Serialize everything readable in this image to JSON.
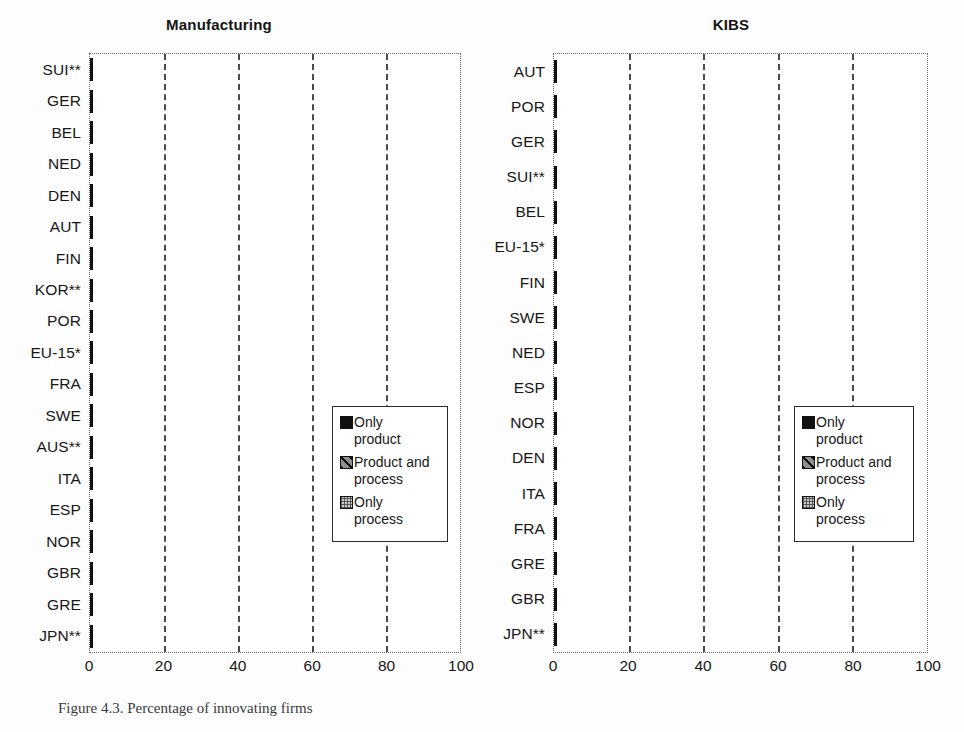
{
  "chart_data": [
    {
      "type": "bar",
      "orientation": "horizontal",
      "stacked": true,
      "title": "Manufacturing",
      "xlabel": "",
      "ylabel": "",
      "xlim": [
        0,
        100
      ],
      "xticks": [
        0,
        20,
        40,
        60,
        80,
        100
      ],
      "gridlines": [
        20,
        40,
        60,
        80
      ],
      "grid": true,
      "legend_position": "inside-right",
      "categories": [
        "SUI**",
        "GER",
        "BEL",
        "NED",
        "DEN",
        "AUT",
        "FIN",
        "KOR**",
        "POR",
        "EU-15*",
        "FRA",
        "SWE",
        "AUS**",
        "ITA",
        "ESP",
        "NOR",
        "GBR",
        "GRE",
        "JPN**"
      ],
      "series": [
        {
          "name": "Only product",
          "values": [
            21,
            24,
            19,
            16,
            19,
            19,
            16,
            17,
            12,
            13,
            18,
            17,
            10,
            10,
            12,
            8,
            10,
            9,
            10
          ]
        },
        {
          "name": "Product and process",
          "values": [
            39,
            24,
            27,
            29,
            27,
            15,
            17,
            10,
            15,
            21,
            16,
            15,
            18,
            17,
            12,
            26,
            9,
            11,
            9
          ]
        },
        {
          "name": "Only process",
          "values": [
            8,
            13,
            13,
            6,
            5,
            10,
            10,
            16,
            16,
            8,
            7,
            9,
            12,
            11,
            13,
            2,
            13,
            6,
            5
          ]
        }
      ],
      "totals": [
        68,
        61,
        59,
        51,
        51,
        44,
        43,
        43,
        43,
        42,
        41,
        41,
        40,
        38,
        37,
        36,
        32,
        26,
        24
      ]
    },
    {
      "type": "bar",
      "orientation": "horizontal",
      "stacked": true,
      "title": "KIBS",
      "xlabel": "",
      "ylabel": "",
      "xlim": [
        0,
        100
      ],
      "xticks": [
        0,
        20,
        40,
        60,
        80,
        100
      ],
      "gridlines": [
        20,
        40,
        60,
        80
      ],
      "grid": true,
      "legend_position": "inside-right",
      "categories": [
        "AUT",
        "POR",
        "GER",
        "SUI**",
        "BEL",
        "EU-15*",
        "FIN",
        "SWE",
        "NED",
        "ESP",
        "NOR",
        "DEN",
        "ITA",
        "FRA",
        "GRE",
        "GBR",
        "JPN**"
      ],
      "series": [
        {
          "name": "Only product",
          "values": [
            33,
            11,
            24,
            11,
            27,
            18,
            28,
            26,
            21,
            18,
            16,
            19,
            13,
            16,
            16,
            17,
            15
          ]
        },
        {
          "name": "Product and process",
          "values": [
            40,
            34,
            32,
            38,
            27,
            30,
            20,
            15,
            25,
            20,
            24,
            22,
            22,
            17,
            17,
            13,
            14
          ]
        },
        {
          "name": "Only process",
          "values": [
            9,
            23,
            9,
            12,
            6,
            5,
            3,
            9,
            2,
            10,
            6,
            5,
            9,
            11,
            7,
            9,
            7
          ]
        }
      ],
      "totals": [
        82,
        68,
        65,
        61,
        60,
        53,
        51,
        50,
        48,
        48,
        46,
        46,
        44,
        44,
        40,
        39,
        36
      ]
    }
  ],
  "legend": {
    "items": [
      {
        "label": "Only\nproduct",
        "swatch": "black-solid"
      },
      {
        "label": "Product and\nprocess",
        "swatch": "diagonal-hatch"
      },
      {
        "label": "Only\nprocess",
        "swatch": "dotted-grey"
      }
    ]
  },
  "colors": {
    "only_product": "#101010",
    "product_and_process": "#8f8f8f",
    "only_process": "#c9c9c9",
    "frame": "#2b2b2b",
    "gridline": "#4a4a4a"
  },
  "caption": "Figure 4.3.  Percentage of innovating firms"
}
